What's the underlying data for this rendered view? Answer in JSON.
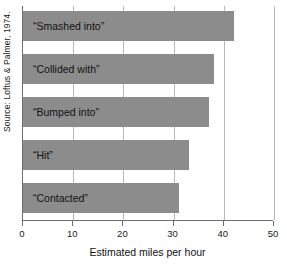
{
  "figure": {
    "source_note": "Source: Loftus & Palmer, 1974."
  },
  "chart_data": {
    "type": "bar",
    "orientation": "horizontal",
    "title": "",
    "xlabel": "Estimated miles per hour",
    "ylabel": "",
    "xlim": [
      0,
      50
    ],
    "grid": true,
    "legend": "none",
    "bar_color": "#8c8c8c",
    "axis_color": "#6f6f6f",
    "gridline_color": "#b9b9b9",
    "xticks": [
      0,
      10,
      20,
      30,
      40,
      50
    ],
    "xtick_labels": [
      "0",
      "10",
      "20",
      "30",
      "40",
      "50"
    ],
    "categories": [
      "“Smashed into”",
      "“Collided with”",
      "“Bumped into”",
      "“Hit”",
      "“Contacted”"
    ],
    "values": [
      42,
      38,
      37,
      33,
      31
    ]
  }
}
